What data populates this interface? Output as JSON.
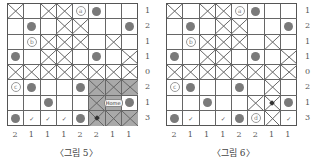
{
  "figures": [
    {
      "caption": "〈그림 5〉",
      "row_labels": [
        "1",
        "2",
        "1",
        "1",
        "0",
        "2",
        "1",
        "3"
      ],
      "col_labels": [
        "2",
        "1",
        "1",
        "1",
        "2",
        "2",
        "1",
        "1"
      ],
      "cells": [
        [
          "X",
          "",
          "X",
          "X",
          "a",
          "dot",
          "",
          ""
        ],
        [
          "",
          "dot",
          "",
          "X",
          "X",
          "",
          "",
          "dot"
        ],
        [
          "",
          "b",
          "X",
          "X",
          "X",
          "",
          "X",
          ""
        ],
        [
          "dot",
          "",
          "X",
          "X",
          "",
          "dot",
          "",
          "X"
        ],
        [
          "X",
          "X",
          "X",
          "X",
          "X",
          "X",
          "X",
          "X"
        ],
        [
          "c",
          "dot",
          "",
          "",
          "dot",
          "XS",
          "XS",
          "XS"
        ],
        [
          "",
          "",
          "dot",
          "",
          "",
          "XS",
          "HOME",
          "dot"
        ],
        [
          "dot",
          "check",
          "check",
          "check",
          "dot",
          "XSM",
          "XS",
          "XS"
        ]
      ],
      "home_label": "Home"
    },
    {
      "caption": "〈그림 6〉",
      "row_labels": [
        "1",
        "2",
        "1",
        "1",
        "0",
        "2",
        "1",
        "3"
      ],
      "col_labels": [
        "2",
        "1",
        "1",
        "1",
        "2",
        "2",
        "1",
        "1"
      ],
      "cells": [
        [
          "X",
          "",
          "X",
          "X",
          "a",
          "dot",
          "",
          ""
        ],
        [
          "",
          "dot",
          "",
          "X",
          "X",
          "",
          "",
          "dot"
        ],
        [
          "",
          "b",
          "X",
          "X",
          "X",
          "",
          "X",
          ""
        ],
        [
          "dot",
          "",
          "X",
          "X",
          "",
          "dot",
          "",
          "X"
        ],
        [
          "X",
          "X",
          "X",
          "X",
          "X",
          "X",
          "X",
          "X"
        ],
        [
          "c",
          "dot",
          "",
          "",
          "dot",
          "",
          "X",
          ""
        ],
        [
          "",
          "",
          "dot",
          "",
          "",
          "X",
          "XM",
          "dot"
        ],
        [
          "dot",
          "check",
          "",
          "check",
          "dot",
          "d",
          "X",
          "check"
        ]
      ]
    }
  ],
  "letters": {
    "a": "ⓐ",
    "b": "ⓑ",
    "c": "ⓒ",
    "d": "ⓓ"
  },
  "check_glyph": "✓",
  "icons": {
    "dot": "filled-circle",
    "X": "cross-mark",
    "check": "check-mark"
  },
  "colors": {
    "dot": "#7a7a7a",
    "shade": "#a9a9a9",
    "grid": "#555555"
  }
}
